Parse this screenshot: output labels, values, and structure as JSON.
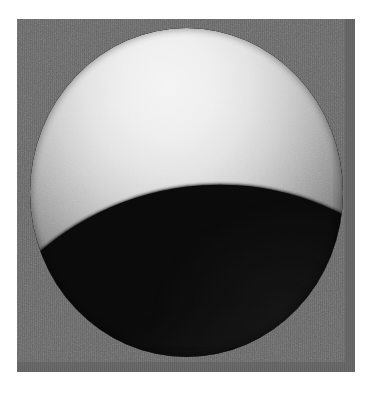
{
  "image": {
    "kind": "rendered-shaded-sphere-photograph",
    "subject_label": "shaded sphere",
    "scene_description": "A grainy grayscale photograph of a matte sphere lit from the upper left, showing a bright highlight cap and a large hard-edged dark shadow region below an elliptical terminator.",
    "canvas": {
      "width_px": 371,
      "height_px": 395,
      "page_background": "#ffffff"
    },
    "plate": {
      "label": "photographic plate",
      "x_px": 17,
      "y_px": 19,
      "width_px": 338,
      "height_px": 353,
      "background_color": "#656565",
      "texture": "uniform film grain / sensor noise"
    },
    "sphere": {
      "label": "sphere",
      "center_x_px": 186,
      "center_y_px": 192,
      "radius_x_px": 157,
      "radius_y_px": 164,
      "bounds": {
        "left_px": 30,
        "top_px": 28,
        "right_px": 343,
        "bottom_px": 357
      }
    },
    "lighting": {
      "direction_label": "upper-left",
      "highlight_center_x_px": 168,
      "highlight_center_y_px": 86,
      "highlight_color": "#f4f4f4",
      "shading_model": "diffuse / Lambertian falloff"
    },
    "terminator": {
      "label": "shadow boundary",
      "shape": "elliptical arc",
      "edge_quality": "hard",
      "left_point_px": [
        58,
        220
      ],
      "mid_point_px": [
        190,
        142
      ],
      "right_point_px": [
        330,
        132
      ]
    },
    "tones": {
      "highlight": "#f4f4f4",
      "midtone": "#949494",
      "limb_falloff": "#3a3a3a",
      "shadow": "#0a0a0a",
      "background_gray": "#656565",
      "page_white": "#ffffff"
    }
  }
}
